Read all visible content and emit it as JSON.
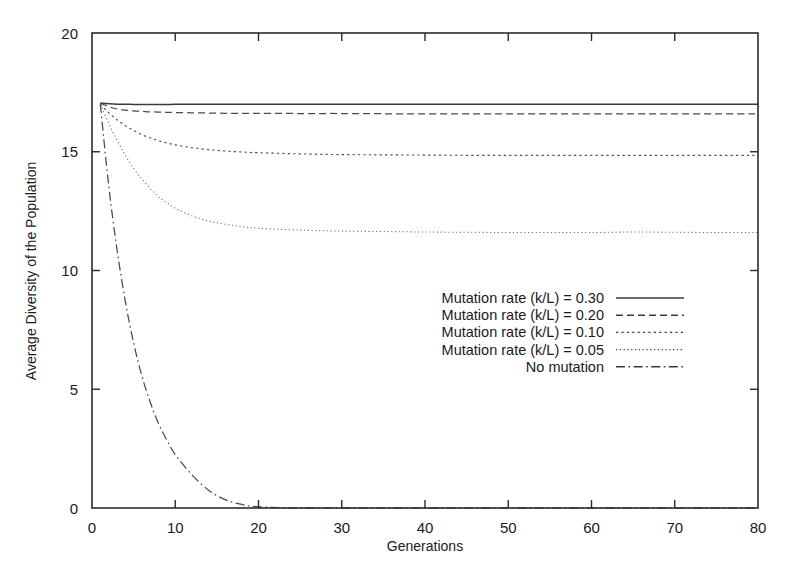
{
  "chart_data": {
    "type": "line",
    "title": "",
    "xlabel": "Generations",
    "ylabel": "Average Diversity of the Population",
    "xlim": [
      0,
      80
    ],
    "ylim": [
      0,
      20
    ],
    "xticks": [
      0,
      10,
      20,
      30,
      40,
      50,
      60,
      70,
      80
    ],
    "yticks": [
      0,
      5,
      10,
      15,
      20
    ],
    "xtick_labels": [
      "0",
      "10",
      "20",
      "30",
      "40",
      "50",
      "60",
      "70",
      "80"
    ],
    "ytick_labels": [
      "0",
      "5",
      "10",
      "15",
      "20"
    ],
    "grid": false,
    "legend_position": "center-right-inside",
    "x": [
      1,
      2,
      3,
      4,
      5,
      6,
      7,
      8,
      9,
      10,
      12,
      14,
      16,
      18,
      20,
      25,
      30,
      35,
      40,
      45,
      50,
      55,
      60,
      65,
      70,
      75,
      80
    ],
    "series": [
      {
        "name": "Mutation rate (k/L) = 0.30",
        "style": "solid",
        "plateau": 17.0,
        "values": [
          17.05,
          17.02,
          17.0,
          17.0,
          16.99,
          16.99,
          16.99,
          16.99,
          16.99,
          17.0,
          17.0,
          17.0,
          17.0,
          17.0,
          17.0,
          17.0,
          17.0,
          17.0,
          17.0,
          17.0,
          17.0,
          17.0,
          17.0,
          17.0,
          17.0,
          17.0,
          17.0
        ]
      },
      {
        "name": "Mutation rate (k/L) = 0.20",
        "style": "dashed",
        "plateau": 16.6,
        "values": [
          17.05,
          16.9,
          16.8,
          16.75,
          16.72,
          16.7,
          16.68,
          16.67,
          16.66,
          16.65,
          16.64,
          16.63,
          16.62,
          16.62,
          16.62,
          16.61,
          16.61,
          16.6,
          16.6,
          16.6,
          16.6,
          16.6,
          16.6,
          16.6,
          16.6,
          16.6,
          16.6
        ]
      },
      {
        "name": "Mutation rate (k/L) = 0.10",
        "style": "dotted",
        "plateau": 14.85,
        "values": [
          17.0,
          16.65,
          16.35,
          16.1,
          15.9,
          15.72,
          15.58,
          15.46,
          15.37,
          15.29,
          15.17,
          15.09,
          15.03,
          14.99,
          14.96,
          14.91,
          14.88,
          14.87,
          14.86,
          14.85,
          14.85,
          14.85,
          14.85,
          14.85,
          14.85,
          14.85,
          14.85
        ]
      },
      {
        "name": "Mutation rate (k/L) = 0.05",
        "style": "fine-dotted",
        "plateau": 11.6,
        "values": [
          17.0,
          16.2,
          15.5,
          14.85,
          14.3,
          13.85,
          13.45,
          13.1,
          12.85,
          12.62,
          12.3,
          12.08,
          11.95,
          11.85,
          11.78,
          11.7,
          11.66,
          11.64,
          11.62,
          11.61,
          11.6,
          11.6,
          11.6,
          11.62,
          11.61,
          11.6,
          11.6
        ]
      },
      {
        "name": "No mutation",
        "style": "dash-dot",
        "plateau": 0.0,
        "values": [
          17.0,
          13.6,
          10.9,
          8.7,
          6.95,
          5.55,
          4.45,
          3.55,
          2.85,
          2.25,
          1.4,
          0.75,
          0.35,
          0.15,
          0.05,
          0.0,
          0.0,
          0.0,
          0.0,
          0.0,
          0.0,
          0.0,
          0.0,
          0.0,
          0.0,
          0.0,
          0.0
        ]
      }
    ],
    "legend_entries": [
      {
        "label": "Mutation rate (k/L) = 0.30",
        "style": "solid"
      },
      {
        "label": "Mutation rate (k/L) = 0.20",
        "style": "dashed"
      },
      {
        "label": "Mutation rate (k/L) = 0.10",
        "style": "dotted"
      },
      {
        "label": "Mutation rate (k/L) = 0.05",
        "style": "fine-dotted"
      },
      {
        "label": "No mutation",
        "style": "dash-dot"
      }
    ],
    "colors": {
      "line": "#3a3a3a",
      "axis": "#2b2b2b",
      "text": "#1a1a1a",
      "background": "#ffffff"
    }
  }
}
